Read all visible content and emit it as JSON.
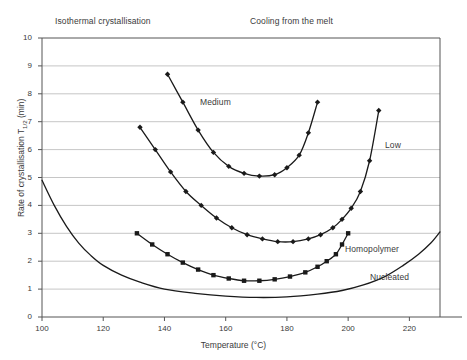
{
  "annotations": {
    "isothermal": "Isothermal crystallisation",
    "cooling": "Cooling from the melt",
    "medium": "Medium",
    "low": "Low",
    "homopolymer": "Homopolymer",
    "nucleated": "Nucleated"
  },
  "axis": {
    "xlabel": "Temperature (°C)",
    "ylabel_pre": "Rate of crystallisation T",
    "ylabel_sub": "1/2",
    "ylabel_post": " (min)",
    "xticks": [
      100,
      120,
      140,
      160,
      180,
      200,
      220
    ],
    "yticks": [
      0,
      1,
      2,
      3,
      4,
      5,
      6,
      7,
      8,
      9,
      10
    ]
  },
  "colors": {
    "line": "#1a1a1a",
    "grid": "#b8b8b8",
    "frame": "#555555",
    "text": "#3a3a3a",
    "background": "#ffffff"
  },
  "chart_data": {
    "type": "line",
    "title": "",
    "xlabel": "Temperature (°C)",
    "ylabel": "Rate of crystallisation T1/2 (min)",
    "xlim": [
      100,
      230
    ],
    "ylim": [
      0,
      10
    ],
    "grid": true,
    "legend": "inline-annotations",
    "series": [
      {
        "name": "Medium",
        "marker": "diamond",
        "x": [
          141,
          146,
          151,
          156,
          161,
          166,
          171,
          176,
          180,
          184,
          187,
          190
        ],
        "y": [
          8.7,
          7.7,
          6.7,
          5.9,
          5.4,
          5.15,
          5.05,
          5.1,
          5.35,
          5.8,
          6.6,
          7.7
        ]
      },
      {
        "name": "Low",
        "marker": "diamond",
        "x": [
          132,
          137,
          142,
          147,
          152,
          157,
          162,
          167,
          172,
          177,
          182,
          187,
          191,
          195,
          198,
          201,
          204,
          207,
          210
        ],
        "y": [
          6.8,
          6.0,
          5.2,
          4.5,
          4.0,
          3.55,
          3.2,
          2.95,
          2.8,
          2.7,
          2.7,
          2.8,
          2.95,
          3.2,
          3.5,
          3.9,
          4.5,
          5.6,
          7.4
        ]
      },
      {
        "name": "Homopolymer",
        "marker": "square",
        "x": [
          131,
          136,
          141,
          146,
          151,
          156,
          161,
          166,
          171,
          176,
          181,
          186,
          190,
          193,
          196,
          198,
          200
        ],
        "y": [
          3.0,
          2.6,
          2.25,
          1.95,
          1.7,
          1.5,
          1.38,
          1.3,
          1.3,
          1.35,
          1.45,
          1.6,
          1.8,
          2.0,
          2.25,
          2.6,
          3.0
        ]
      },
      {
        "name": "Nucleated",
        "marker": "none",
        "x": [
          100,
          104,
          108,
          112,
          116,
          120,
          126,
          132,
          140,
          150,
          160,
          170,
          180,
          190,
          198,
          205,
          212,
          218,
          223,
          227,
          230
        ],
        "y": [
          4.9,
          4.0,
          3.25,
          2.65,
          2.2,
          1.85,
          1.5,
          1.25,
          1.0,
          0.85,
          0.75,
          0.7,
          0.72,
          0.82,
          0.95,
          1.15,
          1.45,
          1.85,
          2.25,
          2.65,
          3.05
        ]
      }
    ]
  }
}
